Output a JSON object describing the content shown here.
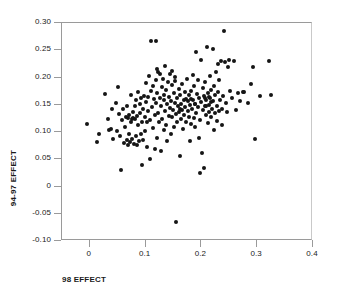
{
  "chart_data": {
    "type": "scatter",
    "title": "",
    "xlabel": "98 EFFECT",
    "ylabel": "94-97 EFFECT",
    "xlim": [
      -0.05,
      0.4
    ],
    "ylim": [
      -0.1,
      0.3
    ],
    "grid": false,
    "legend": null,
    "xticks": [
      "0",
      "0.1",
      "0.2",
      "0.3",
      "0.4"
    ],
    "xtick_values": [
      0,
      0.1,
      0.2,
      0.3,
      0.4
    ],
    "yticks": [
      "-0.10",
      "-0.05",
      "0",
      "0.05",
      "0.10",
      "0.15",
      "0.20",
      "0.25",
      "0.30"
    ],
    "ytick_values": [
      -0.1,
      -0.05,
      0,
      0.05,
      0.1,
      0.15,
      0.2,
      0.25,
      0.3
    ],
    "marker": "filled-circle",
    "marker_color": "#151515",
    "axis_color": "#9a9a9a",
    "background": "#ffffff",
    "n_points": 212,
    "points": [
      [
        -0.005,
        0.115
      ],
      [
        0.013,
        0.082
      ],
      [
        0.016,
        0.097
      ],
      [
        0.027,
        0.17
      ],
      [
        0.032,
        0.123
      ],
      [
        0.034,
        0.104
      ],
      [
        0.038,
        0.105
      ],
      [
        0.04,
        0.143
      ],
      [
        0.042,
        0.088
      ],
      [
        0.046,
        0.153
      ],
      [
        0.048,
        0.101
      ],
      [
        0.05,
        0.182
      ],
      [
        0.052,
        0.133
      ],
      [
        0.054,
        0.093
      ],
      [
        0.055,
        0.031
      ],
      [
        0.057,
        0.122
      ],
      [
        0.06,
        0.143
      ],
      [
        0.061,
        0.079
      ],
      [
        0.063,
        0.109
      ],
      [
        0.064,
        0.128
      ],
      [
        0.066,
        0.086
      ],
      [
        0.067,
        0.148
      ],
      [
        0.068,
        0.077
      ],
      [
        0.069,
        0.125
      ],
      [
        0.07,
        0.097
      ],
      [
        0.071,
        0.131
      ],
      [
        0.072,
        0.081
      ],
      [
        0.073,
        0.119
      ],
      [
        0.074,
        0.168
      ],
      [
        0.075,
        0.124
      ],
      [
        0.076,
        0.088
      ],
      [
        0.077,
        0.137
      ],
      [
        0.078,
        0.126
      ],
      [
        0.079,
        0.078
      ],
      [
        0.08,
        0.147
      ],
      [
        0.081,
        0.123
      ],
      [
        0.082,
        0.092
      ],
      [
        0.083,
        0.158
      ],
      [
        0.084,
        0.077
      ],
      [
        0.085,
        0.129
      ],
      [
        0.086,
        0.112
      ],
      [
        0.087,
        0.174
      ],
      [
        0.088,
        0.084
      ],
      [
        0.089,
        0.135
      ],
      [
        0.09,
        0.151
      ],
      [
        0.091,
        0.096
      ],
      [
        0.092,
        0.163
      ],
      [
        0.093,
        0.118
      ],
      [
        0.094,
        0.04
      ],
      [
        0.095,
        0.142
      ],
      [
        0.096,
        0.086
      ],
      [
        0.097,
        0.166
      ],
      [
        0.098,
        0.127
      ],
      [
        0.099,
        0.102
      ],
      [
        0.1,
        0.19
      ],
      [
        0.101,
        0.155
      ],
      [
        0.102,
        0.118
      ],
      [
        0.103,
        0.073
      ],
      [
        0.104,
        0.139
      ],
      [
        0.105,
        0.164
      ],
      [
        0.106,
        0.203
      ],
      [
        0.107,
        0.05
      ],
      [
        0.108,
        0.122
      ],
      [
        0.109,
        0.176
      ],
      [
        0.11,
        0.267
      ],
      [
        0.112,
        0.145
      ],
      [
        0.113,
        0.107
      ],
      [
        0.114,
        0.185
      ],
      [
        0.115,
        0.16
      ],
      [
        0.116,
        0.131
      ],
      [
        0.117,
        0.069
      ],
      [
        0.118,
        0.196
      ],
      [
        0.119,
        0.153
      ],
      [
        0.12,
        0.089
      ],
      [
        0.121,
        0.172
      ],
      [
        0.122,
        0.134
      ],
      [
        0.123,
        0.211
      ],
      [
        0.124,
        0.118
      ],
      [
        0.125,
        0.206
      ],
      [
        0.126,
        0.163
      ],
      [
        0.127,
        0.066
      ],
      [
        0.128,
        0.147
      ],
      [
        0.129,
        0.182
      ],
      [
        0.13,
        0.124
      ],
      [
        0.131,
        0.198
      ],
      [
        0.132,
        0.104
      ],
      [
        0.133,
        0.159
      ],
      [
        0.134,
        0.138
      ],
      [
        0.135,
        0.221
      ],
      [
        0.136,
        0.113
      ],
      [
        0.137,
        0.177
      ],
      [
        0.138,
        0.151
      ],
      [
        0.139,
        0.084
      ],
      [
        0.14,
        0.192
      ],
      [
        0.141,
        0.129
      ],
      [
        0.142,
        0.165
      ],
      [
        0.118,
        0.267
      ],
      [
        0.143,
        0.144
      ],
      [
        0.144,
        0.207
      ],
      [
        0.145,
        0.096
      ],
      [
        0.146,
        0.157
      ],
      [
        0.147,
        0.127
      ],
      [
        0.148,
        0.186
      ],
      [
        0.149,
        0.14
      ],
      [
        0.15,
        0.171
      ],
      [
        0.151,
        0.109
      ],
      [
        0.152,
        0.154
      ],
      [
        0.153,
        0.194
      ],
      [
        0.154,
        0.133
      ],
      [
        0.155,
        -0.065
      ],
      [
        0.156,
        0.162
      ],
      [
        0.157,
        0.118
      ],
      [
        0.158,
        0.148
      ],
      [
        0.159,
        0.179
      ],
      [
        0.16,
        0.136
      ],
      [
        0.161,
        0.056
      ],
      [
        0.162,
        0.167
      ],
      [
        0.163,
        0.123
      ],
      [
        0.164,
        0.152
      ],
      [
        0.165,
        0.188
      ],
      [
        0.166,
        0.141
      ],
      [
        0.167,
        0.105
      ],
      [
        0.168,
        0.159
      ],
      [
        0.169,
        0.131
      ],
      [
        0.17,
        0.173
      ],
      [
        0.171,
        0.146
      ],
      [
        0.172,
        0.119
      ],
      [
        0.173,
        0.161
      ],
      [
        0.174,
        0.197
      ],
      [
        0.175,
        0.138
      ],
      [
        0.176,
        0.156
      ],
      [
        0.177,
        0.128
      ],
      [
        0.178,
        0.168
      ],
      [
        0.179,
        0.083
      ],
      [
        0.18,
        0.149
      ],
      [
        0.181,
        0.114
      ],
      [
        0.182,
        0.175
      ],
      [
        0.183,
        0.143
      ],
      [
        0.184,
        0.204
      ],
      [
        0.185,
        0.158
      ],
      [
        0.186,
        0.126
      ],
      [
        0.187,
        0.185
      ],
      [
        0.188,
        0.11
      ],
      [
        0.189,
        0.151
      ],
      [
        0.19,
        0.247
      ],
      [
        0.191,
        0.134
      ],
      [
        0.192,
        0.169
      ],
      [
        0.193,
        0.196
      ],
      [
        0.194,
        0.145
      ],
      [
        0.195,
        0.089
      ],
      [
        0.196,
        0.163
      ],
      [
        0.197,
        0.025
      ],
      [
        0.198,
        0.122
      ],
      [
        0.199,
        0.232
      ],
      [
        0.2,
        0.155
      ],
      [
        0.201,
        0.061
      ],
      [
        0.202,
        0.18
      ],
      [
        0.203,
        0.14
      ],
      [
        0.204,
        0.166
      ],
      [
        0.205,
        0.034
      ],
      [
        0.206,
        0.148
      ],
      [
        0.207,
        0.192
      ],
      [
        0.208,
        0.131
      ],
      [
        0.209,
        0.159
      ],
      [
        0.21,
        0.256
      ],
      [
        0.211,
        0.172
      ],
      [
        0.212,
        0.117
      ],
      [
        0.213,
        0.15
      ],
      [
        0.214,
        0.137
      ],
      [
        0.215,
        0.203
      ],
      [
        0.216,
        0.162
      ],
      [
        0.217,
        0.128
      ],
      [
        0.218,
        0.177
      ],
      [
        0.219,
        0.143
      ],
      [
        0.22,
        0.252
      ],
      [
        0.221,
        0.156
      ],
      [
        0.222,
        0.104
      ],
      [
        0.223,
        0.184
      ],
      [
        0.224,
        0.134
      ],
      [
        0.225,
        0.167
      ],
      [
        0.226,
        0.21
      ],
      [
        0.227,
        0.147
      ],
      [
        0.228,
        0.12
      ],
      [
        0.229,
        0.174
      ],
      [
        0.23,
        0.225
      ],
      [
        0.231,
        0.139
      ],
      [
        0.232,
        0.196
      ],
      [
        0.233,
        0.158
      ],
      [
        0.235,
        0.23
      ],
      [
        0.236,
        0.113
      ],
      [
        0.237,
        0.143
      ],
      [
        0.238,
        0.166
      ],
      [
        0.24,
        0.286
      ],
      [
        0.242,
        0.228
      ],
      [
        0.244,
        0.153
      ],
      [
        0.246,
        0.137
      ],
      [
        0.248,
        0.219
      ],
      [
        0.25,
        0.233
      ],
      [
        0.252,
        0.176
      ],
      [
        0.255,
        0.163
      ],
      [
        0.258,
        0.231
      ],
      [
        0.262,
        0.14
      ],
      [
        0.266,
        0.172
      ],
      [
        0.27,
        0.157
      ],
      [
        0.274,
        0.173
      ],
      [
        0.277,
        0.173
      ],
      [
        0.283,
        0.153
      ],
      [
        0.288,
        0.188
      ],
      [
        0.292,
        0.219
      ],
      [
        0.296,
        0.088
      ],
      [
        0.305,
        0.166
      ],
      [
        0.322,
        0.23
      ],
      [
        0.325,
        0.167
      ],
      [
        0.148,
        0.212
      ],
      [
        0.152,
        0.201
      ],
      [
        0.121,
        0.215
      ],
      [
        0.133,
        0.168
      ],
      [
        0.181,
        0.161
      ],
      [
        0.189,
        0.152
      ],
      [
        0.206,
        0.162
      ],
      [
        0.209,
        0.148
      ],
      [
        0.213,
        0.165
      ],
      [
        0.217,
        0.155
      ],
      [
        0.161,
        0.142
      ]
    ]
  },
  "axis_titles": {
    "x": "98 EFFECT",
    "y": "94-97 EFFECT"
  }
}
